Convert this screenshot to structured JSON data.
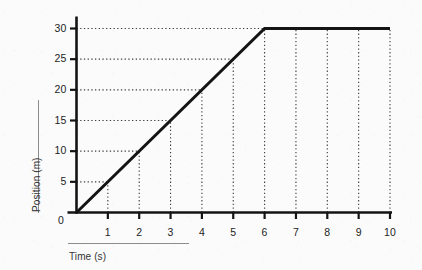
{
  "figure": {
    "background_color": "#fbfbfb",
    "ink_color": "#1a1a1a",
    "grid_color": "#3a3a3a",
    "rule_color": "#8c8c8c"
  },
  "axes": {
    "x_title": "Time (s)",
    "y_title": "Position (m)",
    "origin_label": "0",
    "x_tick_labels": [
      "1",
      "2",
      "3",
      "4",
      "5",
      "6",
      "7",
      "8",
      "9",
      "10"
    ],
    "y_tick_labels": [
      "5",
      "10",
      "15",
      "20",
      "25",
      "30"
    ]
  },
  "chart_data": {
    "type": "line",
    "title": "",
    "xlabel": "Time (s)",
    "ylabel": "Position (m)",
    "xlim": [
      0,
      10
    ],
    "ylim": [
      0,
      30
    ],
    "xticks": [
      0,
      1,
      2,
      3,
      4,
      5,
      6,
      7,
      8,
      9,
      10
    ],
    "yticks": [
      0,
      5,
      10,
      15,
      20,
      25,
      30
    ],
    "grid": true,
    "grid_style": "dotted",
    "legend": "none",
    "series": [
      {
        "name": "Position",
        "x": [
          0,
          1,
          2,
          3,
          4,
          5,
          6,
          7,
          8,
          9,
          10
        ],
        "values": [
          0,
          5,
          10,
          15,
          20,
          25,
          30,
          30,
          30,
          30,
          30
        ],
        "vertices": [
          [
            0,
            0
          ],
          [
            6,
            30
          ],
          [
            10,
            30
          ]
        ],
        "color": "#141414",
        "linewidth": 3
      }
    ],
    "annotations": []
  }
}
